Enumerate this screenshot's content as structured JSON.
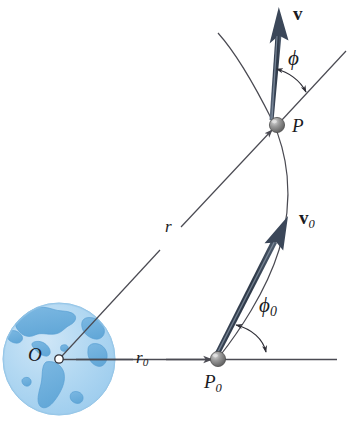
{
  "figure": {
    "background_color": "#ffffff",
    "width": 358,
    "height": 428
  },
  "labels": {
    "velocity": "v",
    "velocity_initial_base": "v",
    "velocity_initial_sub": "0",
    "angle": "ϕ",
    "angle_initial_base": "ϕ",
    "angle_initial_sub": "0",
    "point_P": "P",
    "point_P0_base": "P",
    "point_P0_sub": "0",
    "origin": "O",
    "radius": "r",
    "radius_initial_base": "r",
    "radius_initial_sub": "0"
  },
  "colors": {
    "earth_ocean": "#a9d2ef",
    "earth_ocean_light": "#c4e1f4",
    "earth_land": "#74b3e0",
    "earth_land_dark": "#5ea3d6",
    "earth_outline": "#7fb9e2",
    "vector_dark": "#3c4a5c",
    "vector_mid": "#56677d",
    "vector_light": "#8e9cad",
    "line_stroke": "#4a4a52",
    "marker_sphere_dark": "#6b6b6b",
    "marker_sphere_light": "#c9c9c9",
    "text": "#1a1a22"
  },
  "geometry": {
    "earth_center": [
      59,
      359
    ],
    "earth_radius": 56,
    "point_O": [
      59,
      359
    ],
    "point_P": [
      277,
      125
    ],
    "point_P0": [
      218,
      360
    ],
    "horizontal_line": [
      59,
      359,
      337,
      359
    ],
    "radial_line": [
      59,
      359,
      277,
      125
    ],
    "radial_extension": [
      277,
      125,
      345,
      52
    ],
    "v_arrow": [
      271,
      119,
      282,
      16
    ],
    "v0_arrow": [
      214,
      354,
      285,
      220
    ],
    "trajectory_start": [
      218,
      33
    ],
    "trajectory_end": [
      218,
      360
    ]
  },
  "elements": {
    "earth": "earth-globe",
    "origin_marker": "open-circle-marker",
    "p_marker": "sphere-marker",
    "p0_marker": "sphere-marker"
  }
}
